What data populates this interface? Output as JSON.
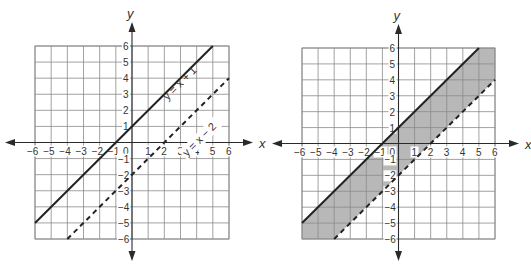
{
  "chart_data": [
    {
      "type": "line",
      "title": "",
      "xlabel": "x",
      "ylabel": "y",
      "xlim": [
        -6,
        6
      ],
      "ylim": [
        -6,
        6
      ],
      "grid": true,
      "x_ticks": [
        -6,
        -5,
        -4,
        -3,
        -2,
        -1,
        0,
        1,
        2,
        3,
        4,
        5,
        6
      ],
      "y_ticks": [
        -6,
        -5,
        -4,
        -3,
        -2,
        -1,
        1,
        2,
        3,
        4,
        5,
        6
      ],
      "series": [
        {
          "name": "y = x + 1",
          "style": "solid",
          "x": [
            -6,
            5
          ],
          "y": [
            -5,
            6
          ]
        },
        {
          "name": "y = x − 2",
          "style": "dashed",
          "x": [
            -4,
            6
          ],
          "y": [
            -6,
            4
          ]
        }
      ],
      "annotations": [
        "y = x + 1",
        "y = x − 2"
      ]
    },
    {
      "type": "area",
      "title": "",
      "xlabel": "x",
      "ylabel": "y",
      "xlim": [
        -6,
        6
      ],
      "ylim": [
        -6,
        6
      ],
      "grid": true,
      "x_ticks": [
        -6,
        -5,
        -4,
        -3,
        -2,
        -1,
        0,
        1,
        2,
        3,
        4,
        5,
        6
      ],
      "y_ticks": [
        -6,
        -5,
        -4,
        -3,
        -2,
        -1,
        1,
        2,
        3,
        4,
        5,
        6
      ],
      "series": [
        {
          "name": "y = x + 1",
          "style": "solid",
          "x": [
            -6,
            5
          ],
          "y": [
            -5,
            6
          ]
        },
        {
          "name": "y = x − 2",
          "style": "dashed",
          "x": [
            -4,
            6
          ],
          "y": [
            -6,
            4
          ]
        }
      ],
      "shaded_region": "x − 2 < y ≤ x + 1 (between the lines)",
      "shade_color": "#b8b8b8"
    }
  ],
  "labels": {
    "x_axis": "x",
    "y_axis": "y",
    "line1": "y = x + 1",
    "line2": "y = x − 2"
  }
}
